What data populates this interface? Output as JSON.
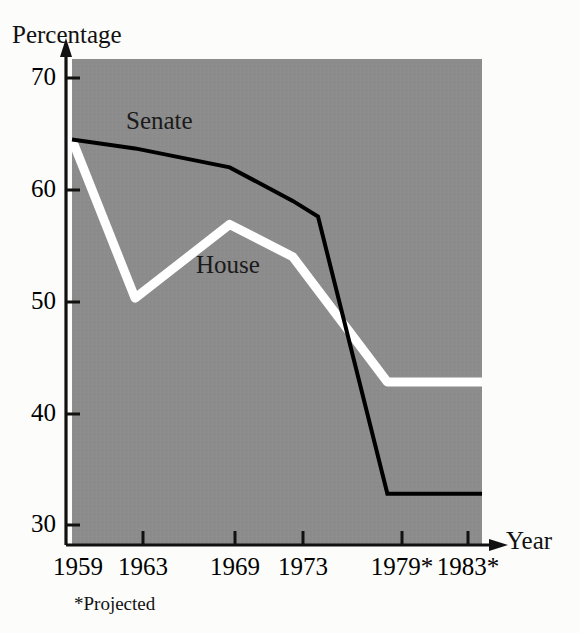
{
  "chart_data": {
    "type": "line",
    "title": "",
    "subtitle": "",
    "xlabel": "Year",
    "ylabel": "Percentage",
    "x": [
      1959,
      1963,
      1969,
      1973,
      1979,
      1983
    ],
    "xtick_labels": [
      "1959",
      "1963",
      "1969",
      "1973",
      "1979*",
      "1983*"
    ],
    "ytick_labels": [
      "70",
      "60",
      "50",
      "40",
      "30"
    ],
    "ytick_values": [
      70,
      60,
      50,
      40,
      30
    ],
    "ylim": [
      26,
      73
    ],
    "xlim": [
      1959,
      1985
    ],
    "grid": false,
    "legend_position": "inline-annotation",
    "footnote": "*Projected",
    "plot_background_color": "#8c8c8c",
    "figure_background_color": "#fcfcfa",
    "series": [
      {
        "name": "Senate",
        "color": "#000000",
        "values": [
          64.5,
          63.7,
          62.0,
          59.0,
          32.8,
          32.8
        ],
        "knee_point": {
          "x": 1974.6,
          "y": 57.6
        },
        "label_text": "Senate"
      },
      {
        "name": "House",
        "color": "#ffffff",
        "values": [
          64.5,
          50.3,
          56.9,
          54.0,
          42.8,
          42.8
        ],
        "label_text": "House"
      }
    ],
    "annotations": [
      {
        "name": "senate-label",
        "text": "Senate"
      },
      {
        "name": "house-label",
        "text": "House"
      }
    ]
  },
  "axes": {
    "y_axis_title": "Percentage",
    "x_axis_title": "Year",
    "y_ticks": [
      {
        "label": "70"
      },
      {
        "label": "60"
      },
      {
        "label": "50"
      },
      {
        "label": "40"
      },
      {
        "label": "30"
      }
    ],
    "x_ticks": [
      {
        "label": "1959"
      },
      {
        "label": "1963"
      },
      {
        "label": "1969"
      },
      {
        "label": "1973"
      },
      {
        "label": "1979*"
      },
      {
        "label": "1983*"
      }
    ]
  },
  "notes": {
    "projected": "*Projected"
  }
}
